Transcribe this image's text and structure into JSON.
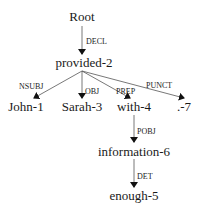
{
  "diagram": {
    "type": "dependency-parse-tree",
    "nodes": [
      {
        "id": "root",
        "label": "Root",
        "x": 82,
        "y": 11
      },
      {
        "id": "provided",
        "label": "provided-2",
        "x": 84,
        "y": 56
      },
      {
        "id": "john",
        "label": "John-1",
        "x": 26,
        "y": 100
      },
      {
        "id": "sarah",
        "label": "Sarah-3",
        "x": 82,
        "y": 100
      },
      {
        "id": "with",
        "label": "with-4",
        "x": 134,
        "y": 100
      },
      {
        "id": "punct",
        "label": ".-7",
        "x": 183,
        "y": 100
      },
      {
        "id": "information",
        "label": "information-6",
        "x": 134,
        "y": 144
      },
      {
        "id": "enough",
        "label": "enough-5",
        "x": 134,
        "y": 189
      }
    ],
    "edges": [
      {
        "from": "root",
        "to": "provided",
        "label": "DECL"
      },
      {
        "from": "provided",
        "to": "john",
        "label": "NSUBJ"
      },
      {
        "from": "provided",
        "to": "sarah",
        "label": "OBJ"
      },
      {
        "from": "provided",
        "to": "with",
        "label": "PREP"
      },
      {
        "from": "provided",
        "to": "punct",
        "label": "PUNCT"
      },
      {
        "from": "with",
        "to": "information",
        "label": "POBJ"
      },
      {
        "from": "information",
        "to": "enough",
        "label": "DET"
      }
    ]
  },
  "labels": {
    "root": "Root",
    "provided": "provided-2",
    "john": "John-1",
    "sarah": "Sarah-3",
    "with": "with-4",
    "punct": ".-7",
    "information": "information-6",
    "enough": "enough-5",
    "decl": "DECL",
    "nsubj": "NSUBJ",
    "obj": "OBJ",
    "prep": "PREP",
    "punct_rel": "PUNCT",
    "pobj": "POBJ",
    "det": "DET"
  },
  "colors": {
    "line": "#333333",
    "text": "#1a1a1a",
    "background": "#ffffff"
  }
}
